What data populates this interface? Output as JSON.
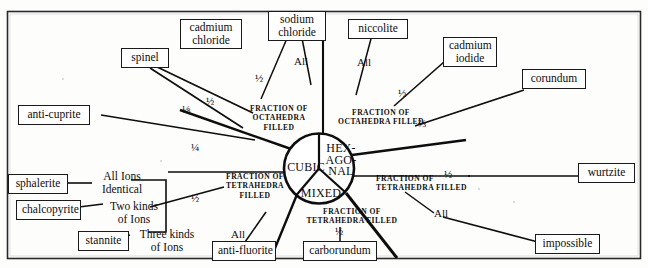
{
  "figure": {
    "type": "radial-classification-diagram",
    "center_circle": {
      "sectors": [
        {
          "name": "cubic",
          "label": "CUBIC"
        },
        {
          "name": "hexagonal",
          "label": "HEX-\nAGO-\nNAL",
          "lines": [
            "HEX-",
            "AGO-",
            "NAL"
          ]
        },
        {
          "name": "mixed",
          "label": "MIXED"
        }
      ]
    },
    "axis_labels": [
      {
        "id": "oct-left",
        "lines": [
          "FRACTION OF",
          "OCTAHEDRA",
          "FILLED"
        ]
      },
      {
        "id": "oct-right",
        "lines": [
          "FRACTION OF",
          "OCTAHEDRA FILLED"
        ]
      },
      {
        "id": "tet-left",
        "lines": [
          "FRACTION OF",
          "TETRAHEDRA",
          "FILLED"
        ]
      },
      {
        "id": "tet-right",
        "lines": [
          "FRACTION OF",
          "TETRAHEDRA FILLED"
        ]
      },
      {
        "id": "tet-bottom-left",
        "lines": [
          "FRACTION OF",
          "TETRAHEDRA FILLED"
        ]
      },
      {
        "id": "tet-bottom-center",
        "lines": [
          "FRACTION OF",
          "TETRAHEDRA FILLED"
        ]
      }
    ],
    "nodes": [
      {
        "id": "spinel",
        "label": "spinel",
        "lines": [
          "spinel"
        ]
      },
      {
        "id": "cadmium-chloride",
        "label": "cadmium chloride",
        "lines": [
          "cadmium",
          "chloride"
        ]
      },
      {
        "id": "sodium-chloride",
        "label": "sodium chloride",
        "lines": [
          "sodium",
          "chloride"
        ]
      },
      {
        "id": "niccolite",
        "label": "niccolite",
        "lines": [
          "niccolite"
        ]
      },
      {
        "id": "cadmium-iodide",
        "label": "cadmium iodide",
        "lines": [
          "cadmium",
          "iodide"
        ]
      },
      {
        "id": "corundum",
        "label": "corundum",
        "lines": [
          "corundum"
        ]
      },
      {
        "id": "anti-cuprite",
        "label": "anti-cuprite",
        "lines": [
          "anti-cuprite"
        ]
      },
      {
        "id": "wurtzite",
        "label": "wurtzite",
        "lines": [
          "wurtzite"
        ]
      },
      {
        "id": "sphalerite",
        "label": "sphalerite",
        "lines": [
          "sphalerite"
        ]
      },
      {
        "id": "chalcopyrite",
        "label": "chalcopyrite",
        "lines": [
          "chalcopyrite"
        ]
      },
      {
        "id": "stannite",
        "label": "stannite",
        "lines": [
          "stannite"
        ]
      },
      {
        "id": "anti-fluorite",
        "label": "anti-fluorite",
        "lines": [
          "anti-fluorite"
        ]
      },
      {
        "id": "carborundum",
        "label": "carborundum",
        "lines": [
          "carborundum"
        ]
      },
      {
        "id": "impossible",
        "label": "impossible",
        "lines": [
          "impossible"
        ]
      }
    ],
    "fraction_labels": [
      {
        "id": "spinel-eighth",
        "value": "⅛"
      },
      {
        "id": "spinel-half",
        "value": "½"
      },
      {
        "id": "cadmium-chloride-half",
        "value": "½"
      },
      {
        "id": "sodium-chloride-all",
        "value": "All"
      },
      {
        "id": "niccolite-all",
        "value": "All"
      },
      {
        "id": "cadmium-iodide-half",
        "value": "½"
      },
      {
        "id": "corundum-twothirds",
        "value": "⅔"
      },
      {
        "id": "anti-cuprite-quarter",
        "value": "¼"
      },
      {
        "id": "sphalerite-group-half",
        "value": "½"
      },
      {
        "id": "wurtzite-half",
        "value": "½"
      },
      {
        "id": "anti-fluorite-all",
        "value": "All"
      },
      {
        "id": "carborundum-half",
        "value": "½"
      },
      {
        "id": "impossible-all",
        "value": "All"
      }
    ],
    "ion_labels": [
      {
        "id": "all-ions-identical",
        "lines": [
          "All Ions",
          "Identical"
        ]
      },
      {
        "id": "two-kinds-of-ions",
        "lines": [
          "Two kinds",
          "of Ions"
        ]
      },
      {
        "id": "three-kinds-of-ions",
        "lines": [
          "Three kinds",
          "of Ions"
        ]
      }
    ],
    "colors": {
      "ink": "#0d0d0d",
      "paper": "#fdfdfc",
      "border": "#1a1a1a"
    }
  }
}
